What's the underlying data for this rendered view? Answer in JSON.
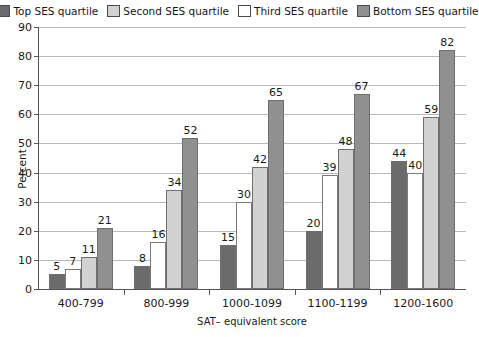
{
  "chart_data": {
    "type": "bar",
    "title": "",
    "xlabel": "SAT– equivalent score",
    "ylabel": "Percent",
    "ylim": [
      0,
      90
    ],
    "yticks": [
      0,
      10,
      20,
      30,
      40,
      50,
      60,
      70,
      80,
      90
    ],
    "grid": true,
    "legend_position": "top",
    "categories": [
      "400-799",
      "800-999",
      "1000-1099",
      "1100-1199",
      "1200-1600"
    ],
    "series": [
      {
        "name": "Top SES quartile",
        "color": "#6b6b6b",
        "values": [
          5,
          8,
          15,
          20,
          44
        ]
      },
      {
        "name": "Third SES quartile",
        "color": "#ffffff",
        "values": [
          7,
          16,
          30,
          39,
          40
        ]
      },
      {
        "name": "Second SES quartile",
        "color": "#d2d2d2",
        "values": [
          11,
          34,
          42,
          48,
          59
        ]
      },
      {
        "name": "Bottom SES quartile",
        "color": "#909090",
        "values": [
          21,
          52,
          65,
          67,
          82
        ]
      }
    ],
    "legend_order": [
      {
        "name": "Top SES quartile",
        "color": "#6b6b6b"
      },
      {
        "name": "Second SES quartile",
        "color": "#d2d2d2"
      },
      {
        "name": "Third SES quartile",
        "color": "#ffffff"
      },
      {
        "name": "Bottom SES quartile",
        "color": "#909090"
      }
    ]
  }
}
